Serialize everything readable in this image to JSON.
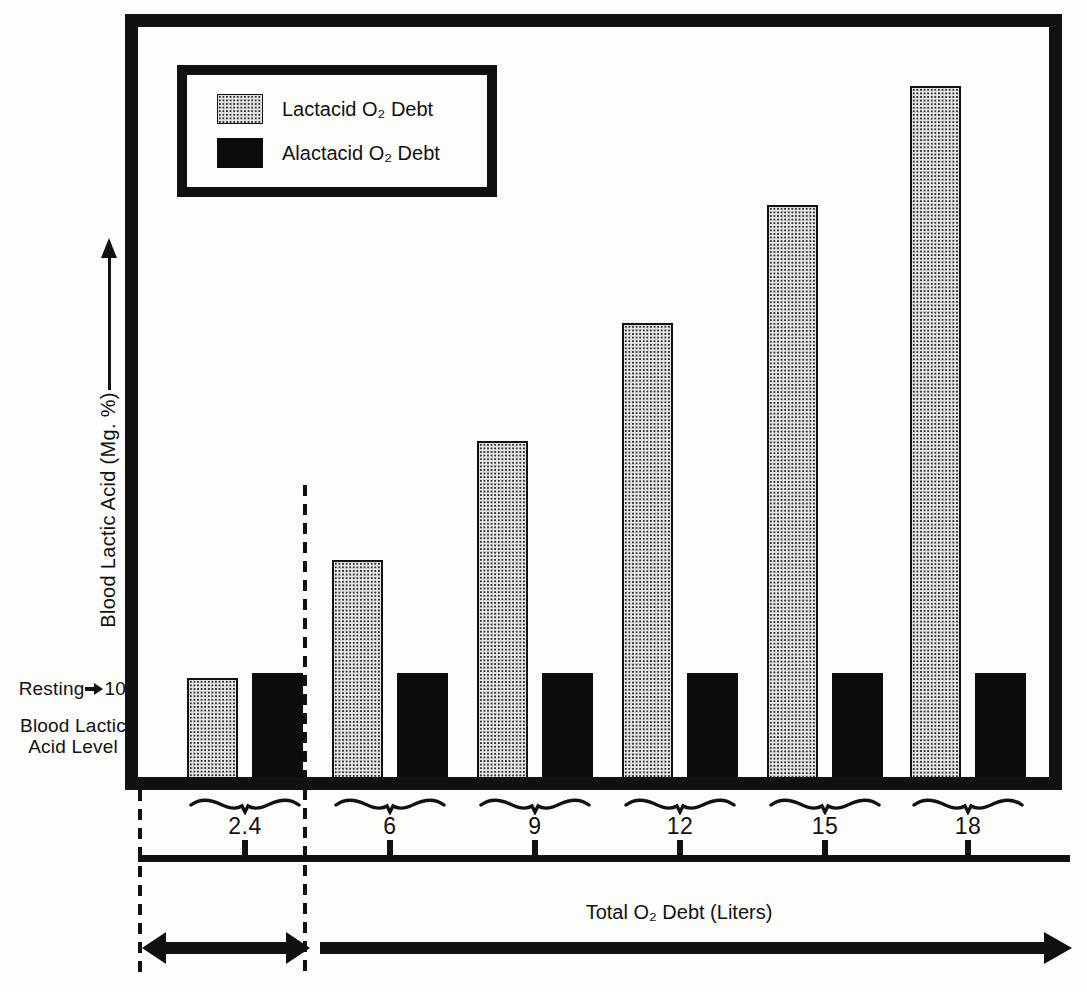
{
  "figure": {
    "y_axis_label": "Blood Lactic Acid (Mg. %)",
    "x_axis_label": "Total O₂ Debt (Liters)",
    "resting_label": "Resting",
    "resting_value": "10",
    "resting_sublabel_line1": "Blood Lactic",
    "resting_sublabel_line2": "Acid Level"
  },
  "legend": {
    "items": [
      {
        "label": "Lactacid O₂ Debt",
        "swatch": "stipple-pattern"
      },
      {
        "label": "Alactacid O₂ Debt",
        "swatch": "solid-black"
      }
    ]
  },
  "chart_data": {
    "type": "bar",
    "categories": [
      "2.4",
      "6",
      "9",
      "12",
      "15",
      "18"
    ],
    "series": [
      {
        "name": "Lactacid O₂ Debt",
        "values": [
          10,
          22,
          34,
          46,
          58,
          70
        ]
      },
      {
        "name": "Alactacid O₂ Debt",
        "values": [
          10.5,
          10.5,
          10.5,
          10.5,
          10.5,
          10.5
        ]
      }
    ],
    "title": "",
    "xlabel": "Total O₂ Debt (Liters)",
    "ylabel": "Blood Lactic Acid (Mg. %)",
    "ylim": [
      0,
      76
    ],
    "y_reference": {
      "value": 10,
      "label": "Resting blood lactic acid level"
    },
    "grid": false,
    "legend_position": "top-left",
    "annotations": [
      "Resting→10",
      "Blood Lactic Acid Level"
    ]
  },
  "colors": {
    "ink": "#111111",
    "paper": "#fdfdfc",
    "stipple_bg": "#e4e4e4",
    "stipple_dot": "#2d2d2d"
  }
}
